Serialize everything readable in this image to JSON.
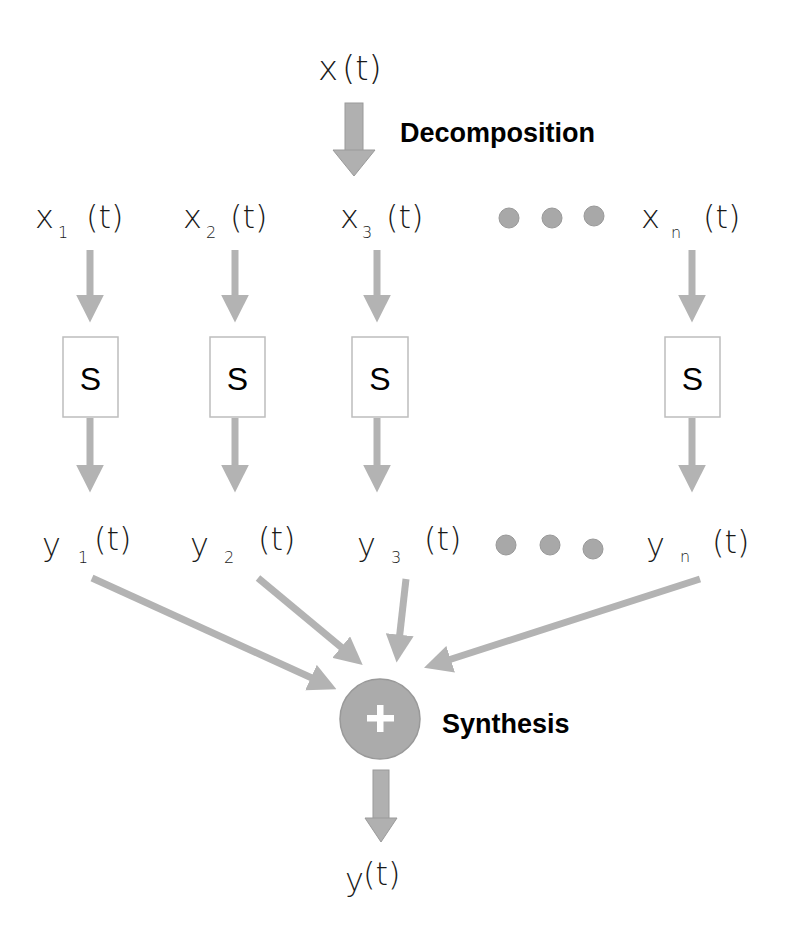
{
  "diagram": {
    "input": {
      "label": "x(t)",
      "base": "x",
      "arg": "(t)"
    },
    "decomposition_label": "Decomposition",
    "branches": [
      {
        "input_base": "x",
        "sub": "1",
        "arg": "(t)",
        "block": "S",
        "output_base": "y",
        "output_sub": "1"
      },
      {
        "input_base": "x",
        "sub": "2",
        "arg": "(t)",
        "block": "S",
        "output_base": "y",
        "output_sub": "2"
      },
      {
        "input_base": "x",
        "sub": "3",
        "arg": "(t)",
        "block": "S",
        "output_base": "y",
        "output_sub": "3"
      },
      {
        "input_base": "x",
        "sub": "n",
        "arg": "(t)",
        "block": "S",
        "output_base": "y",
        "output_sub": "n"
      }
    ],
    "ellipsis": "• • •",
    "summer_symbol": "+",
    "synthesis_label": "Synthesis",
    "output": {
      "label": "y(t)",
      "base": "y",
      "arg": "(t)"
    },
    "colors": {
      "arrow": "#b3b3b3",
      "dots": "#a8a8a8",
      "summer_fill": "#ababab",
      "box_border": "#bdbdbd",
      "text": "#000000"
    }
  }
}
